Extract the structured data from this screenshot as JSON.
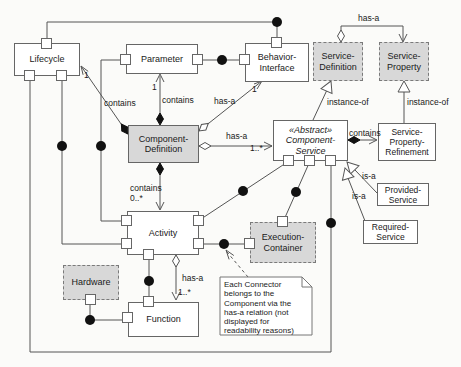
{
  "nodes": {
    "lifecycle": {
      "lines": [
        "Lifecycle"
      ]
    },
    "parameter": {
      "lines": [
        "Parameter"
      ]
    },
    "behavior_interface": {
      "lines": [
        "Behavior-",
        "Interface"
      ]
    },
    "service_definition": {
      "lines": [
        "Service-",
        "Definition"
      ]
    },
    "service_property": {
      "lines": [
        "Service-",
        "Property"
      ]
    },
    "component_definition": {
      "lines": [
        "Component-",
        "Definition"
      ]
    },
    "component_service": {
      "stereotype": "«Abstract»",
      "lines": [
        "Component-",
        "Service"
      ]
    },
    "service_property_refinement": {
      "lines": [
        "Service-",
        "Property-",
        "Refinement"
      ]
    },
    "provided_service": {
      "lines": [
        "Provided-",
        "Service"
      ]
    },
    "required_service": {
      "lines": [
        "Required-",
        "Service"
      ]
    },
    "activity": {
      "lines": [
        "Activity"
      ]
    },
    "execution_container": {
      "lines": [
        "Execution-",
        "Container"
      ]
    },
    "hardware": {
      "lines": [
        "Hardware"
      ]
    },
    "function": {
      "lines": [
        "Function"
      ]
    }
  },
  "labels": {
    "top_has_a": "has-a",
    "lc_contains": "contains",
    "lc_mult": "1",
    "par_contains": "contains",
    "par_mult": "1",
    "bi_hasa": "has-a",
    "bi_mult": "1",
    "cs_hasa": "has-a",
    "cs_mult": "1..*",
    "inst_left": "instance-of",
    "inst_right": "instance-of",
    "spr_contains": "contains",
    "isa_prov": "is-a",
    "isa_req": "is-a",
    "act_contains": "contains",
    "act_mult": "0..*",
    "fn_hasa": "has-a",
    "fn_mult": "1..*"
  },
  "note_lines": [
    "Each Connector",
    "belongs to the",
    "Component via the",
    "has-a relation (not",
    "displayed for",
    "readability reasons)"
  ],
  "colors": {
    "shaded_fill": "#d8d8d8",
    "line": "#555555",
    "connector_ball": "#111111",
    "background": "#fbfbf9"
  }
}
